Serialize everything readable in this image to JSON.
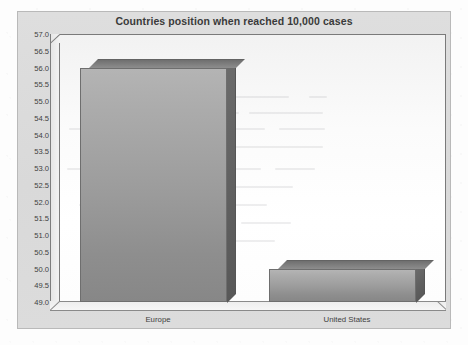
{
  "chart_data": {
    "type": "bar",
    "title": "Countries position when reached 10,000 cases",
    "xlabel": "",
    "ylabel": "",
    "categories": [
      "Europe",
      "United States"
    ],
    "values": [
      56.0,
      50.0
    ],
    "series": [
      {
        "name": "Position",
        "values": [
          56.0,
          50.0
        ]
      }
    ],
    "ylim": [
      49.0,
      57.0
    ],
    "ytick_step": 0.5,
    "yticks": [
      "57.0",
      "56.5",
      "56.0",
      "55.5",
      "55.0",
      "54.5",
      "54.0",
      "53.5",
      "53.0",
      "52.5",
      "52.0",
      "51.5",
      "51.0",
      "50.5",
      "50.0",
      "49.5",
      "49.0"
    ],
    "grid": false,
    "legend": false,
    "legend_position": "none",
    "style": "3d-column",
    "colors": {
      "bar_face": "#9d9d9d",
      "bar_top": "#7d7d7d",
      "bar_side": "#5f5f5f",
      "plot_background": "#ffffff",
      "chart_background": "#dcdcdc",
      "axis_line": "#7d7d7d",
      "title_text": "#3a3a3a",
      "tick_text": "#3f3f3f"
    }
  }
}
